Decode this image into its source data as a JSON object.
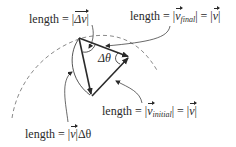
{
  "diagram": {
    "type": "velocity-vector-triangle",
    "colors": {
      "ink": "#2a2a2a",
      "arc": "#8a8a8a",
      "background": "#ffffff"
    },
    "vertices": {
      "top": [
        79,
        38
      ],
      "right": [
        129,
        57
      ],
      "bottom": [
        92,
        96
      ]
    },
    "vectors": [
      {
        "name": "v_final",
        "from": "top",
        "to": "right"
      },
      {
        "name": "v_initial",
        "from": "bottom",
        "to": "right"
      },
      {
        "name": "delta_v",
        "from": "top",
        "to": "bottom"
      }
    ],
    "angle_label": "Δθ",
    "labels": {
      "delta_v": {
        "prefix": "length = |",
        "vector": "Δv",
        "suffix": "|"
      },
      "v_final": {
        "prefix": "length = |",
        "vector": "v",
        "subscript": "final",
        "middle": "| = |",
        "vector2": "v",
        "suffix": "|"
      },
      "v_initial": {
        "prefix": "length = |",
        "vector": "v",
        "subscript": "initial",
        "middle": "| = |",
        "vector2": "v",
        "suffix": "|"
      },
      "arc_length": {
        "prefix": "length = |",
        "vector": "v",
        "suffix": "|Δθ"
      }
    }
  }
}
